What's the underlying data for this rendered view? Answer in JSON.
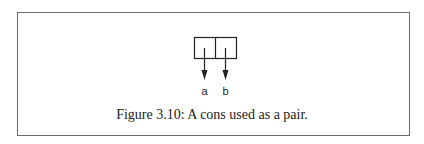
{
  "diagram": {
    "type": "cons-cell",
    "cells": [
      {
        "part": "car",
        "points_to": "a"
      },
      {
        "part": "cdr",
        "points_to": "b"
      }
    ],
    "labels": {
      "car": "a",
      "cdr": "b"
    }
  },
  "caption": "Figure 3.10: A cons used as a pair."
}
